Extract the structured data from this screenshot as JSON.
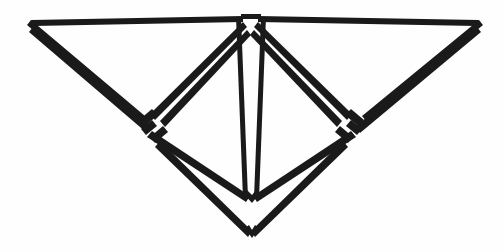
{
  "figure": {
    "title": "Geometric line drawing",
    "description": "Symmetric black line drawing of nested triangular and chevron forms",
    "alt_text": "Abstract symmetric figure composed of double-stroked triangles forming a wide inverted V with an inner diamond, a central vertical spine and two interlocking joints at mid-left and mid-right",
    "background_color": "#fefefe",
    "ink_color": "#1a1a1a",
    "canvas": {
      "width": 503,
      "height": 252
    },
    "stroke_width": 5,
    "symmetry": "bilateral-vertical",
    "center_x": 251,
    "parts": [
      {
        "name": "outer-left-wing",
        "description": "Large triangle from left corner to top center"
      },
      {
        "name": "outer-right-wing",
        "description": "Large triangle from right corner to top center"
      },
      {
        "name": "inner-left-triangle",
        "description": "Inner triangle left of center spine"
      },
      {
        "name": "inner-right-triangle",
        "description": "Inner triangle right of center spine"
      },
      {
        "name": "center-spine",
        "description": "Vertical double line from top notch to lower tip"
      },
      {
        "name": "bottom-chevron",
        "description": "Lower nested V form"
      },
      {
        "name": "left-joint",
        "description": "Interlocking notch at mid-left"
      },
      {
        "name": "right-joint",
        "description": "Interlocking notch at mid-right"
      }
    ],
    "vertices": {
      "top_left_corner": [
        31,
        22
      ],
      "top_right_corner": [
        479,
        22
      ],
      "top_center_left": [
        242,
        18
      ],
      "top_center_right": [
        258,
        18
      ],
      "left_joint": [
        148,
        124
      ],
      "right_joint": [
        354,
        124
      ],
      "inner_bottom_tip": [
        252,
        200
      ],
      "outer_bottom_tip": [
        252,
        236
      ]
    }
  }
}
